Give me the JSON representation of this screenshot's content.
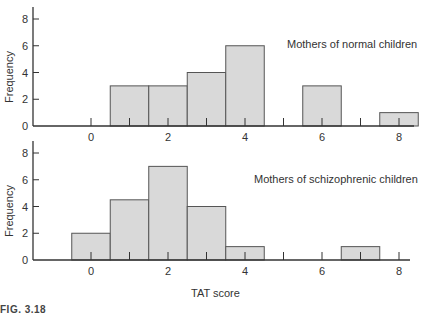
{
  "figure_label": "FIG. 3.18",
  "chart_data": [
    {
      "type": "bar",
      "subtype": "histogram",
      "title": "Mothers of normal children",
      "xlabel": "TAT score",
      "ylabel": "Frequency",
      "x_ticks": [
        0,
        2,
        4,
        6,
        8
      ],
      "y_ticks": [
        0,
        2,
        4,
        6,
        8
      ],
      "xlim": [
        -1.5,
        8.5
      ],
      "ylim": [
        0,
        9
      ],
      "bin_width": 1,
      "bin_centers": [
        1,
        2,
        3,
        4,
        6,
        8
      ],
      "values": [
        3,
        3,
        4,
        6,
        3,
        1
      ],
      "grid": false
    },
    {
      "type": "bar",
      "subtype": "histogram",
      "title": "Mothers of schizophrenic children",
      "xlabel": "TAT score",
      "ylabel": "Frequency",
      "x_ticks": [
        0,
        2,
        4,
        6,
        8
      ],
      "y_ticks": [
        0,
        2,
        4,
        6,
        8
      ],
      "xlim": [
        -1.5,
        8.5
      ],
      "ylim": [
        0,
        9
      ],
      "bin_width": 1,
      "bin_centers": [
        0,
        1,
        2,
        3,
        4,
        7
      ],
      "values": [
        2,
        4.5,
        7,
        4,
        1,
        1
      ],
      "grid": false
    }
  ],
  "charts": {
    "top": {
      "title": "Mothers of normal children",
      "ylabel": "Frequency"
    },
    "bottom": {
      "title": "Mothers of schizophrenic children",
      "ylabel": "Frequency"
    },
    "xlabel": "TAT score"
  },
  "colors": {
    "bar_fill": "#d9d9d9",
    "bar_edge": "#555555",
    "axis": "#333333"
  }
}
